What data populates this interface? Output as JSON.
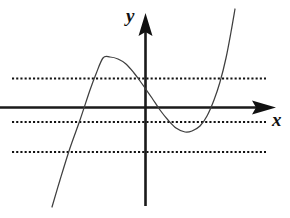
{
  "figure": {
    "name": "cubic-function-graph",
    "background_color": "#ffffff",
    "width": 290,
    "height": 218
  },
  "axes": {
    "x_axis": {
      "label": "x",
      "color": "#1a1a1a",
      "style": "solid-with-arrow",
      "y_pixel": 107,
      "x_start_pixel": 0,
      "x_end_pixel": 276,
      "stroke_width": 2.4
    },
    "y_axis": {
      "label": "y",
      "color": "#1a1a1a",
      "style": "solid-with-arrow",
      "x_pixel": 145,
      "y_start_pixel": 206,
      "y_end_pixel": 13,
      "stroke_width": 2.4
    },
    "origin": {
      "x": 145,
      "y": 107
    }
  },
  "gridlines": {
    "style": "dotted",
    "color": "#111111",
    "dash_pattern": "2.1 2.1",
    "stroke_width": 2.0,
    "x_start_pixel": 12,
    "x_end_pixel": 266,
    "y_pixels": [
      38,
      78.5,
      122,
      152
    ],
    "count": 4
  },
  "chart_data": {
    "type": "line",
    "title": "",
    "subtitle": "",
    "xlabel": "x",
    "ylabel": "y",
    "grid": true,
    "legend_position": "none",
    "axis_style": "arrows",
    "curve_color": "#3f3f3f",
    "curve_stroke_width": 1.25,
    "series": [
      {
        "name": "cubic curve",
        "x": [
          52,
          60,
          70,
          80,
          90,
          96,
          103,
          110,
          118,
          126,
          134,
          140,
          145,
          152,
          160,
          168,
          176,
          185,
          192,
          200,
          207,
          214,
          220,
          226,
          231,
          235
        ],
        "y": [
          207,
          180,
          148,
          120,
          90,
          74,
          58,
          57,
          59,
          64,
          73,
          81,
          88,
          98,
          110,
          120,
          128,
          132,
          131,
          126,
          116,
          100,
          82,
          58,
          32,
          9
        ]
      }
    ],
    "features": {
      "local_maximum": {
        "x": 103,
        "y": 58,
        "label": "local maximum"
      },
      "local_minimum": {
        "x": 185,
        "y": 132,
        "label": "local minimum"
      },
      "x_intercepts": [
        85,
        150,
        206
      ],
      "y_intercept": 88
    },
    "gridline_levels": [
      38,
      78.5,
      122,
      152
    ],
    "xlim": [
      0,
      290
    ],
    "ylim": [
      218,
      0
    ]
  }
}
